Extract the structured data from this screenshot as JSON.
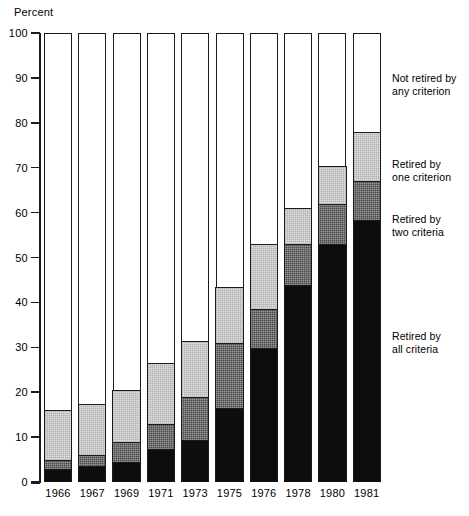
{
  "axis_title": "Percent",
  "y_axis": {
    "label": "Percent",
    "min": 0,
    "max": 100,
    "step": 10,
    "ticks": [
      "0",
      "10",
      "20",
      "30",
      "40",
      "50",
      "60",
      "70",
      "80",
      "90",
      "100"
    ]
  },
  "legend": {
    "entries": [
      {
        "key": "not_retired",
        "line1": "Not retired by",
        "line2": "any criterion",
        "color": "#ffffff"
      },
      {
        "key": "one_criterion",
        "line1": "Retired by",
        "line2": "one criterion",
        "color": "#dedede"
      },
      {
        "key": "two_criteria",
        "line1": "Retired by",
        "line2": "two criteria",
        "color": "#4a4a4a"
      },
      {
        "key": "all_criteria",
        "line1": "Retired by",
        "line2": "all criteria",
        "color": "#0d0d0d"
      }
    ]
  },
  "chart_data": {
    "type": "bar",
    "subtype": "stacked-bar-100-percent",
    "title": "",
    "xlabel": "",
    "ylabel": "Percent",
    "ylim": [
      0,
      100
    ],
    "grid": false,
    "legend_position": "right",
    "categories": [
      "1966",
      "1967",
      "1969",
      "1971",
      "1973",
      "1975",
      "1976",
      "1978",
      "1980",
      "1981"
    ],
    "series": [
      {
        "name": "Retired by all criteria",
        "color": "#0d0d0d",
        "values": [
          3,
          3.5,
          4.5,
          7.5,
          9.5,
          16.5,
          30,
          44,
          53,
          58.5
        ]
      },
      {
        "name": "Retired by two criteria",
        "color": "#4a4a4a",
        "values": [
          2,
          2.5,
          4.5,
          5.5,
          9.5,
          14.5,
          8.5,
          9,
          9,
          8.5
        ]
      },
      {
        "name": "Retired by one criterion",
        "color": "#dedede",
        "values": [
          11,
          11.5,
          11.5,
          13.5,
          12.5,
          12.5,
          14.5,
          8,
          8.5,
          11
        ]
      },
      {
        "name": "Not retired by any criterion",
        "color": "#ffffff",
        "values": [
          84,
          82.5,
          79.5,
          73.5,
          68.5,
          56.5,
          47,
          39,
          29.5,
          22
        ]
      }
    ],
    "cumulative_tops": {
      "all_criteria": [
        3,
        3.5,
        4.5,
        7.5,
        9.5,
        16.5,
        30,
        44,
        53,
        58.5
      ],
      "two_criteria": [
        5,
        6,
        9,
        13,
        19,
        31,
        38.5,
        53,
        62,
        67
      ],
      "one_criterion": [
        16,
        17.5,
        20.5,
        26.5,
        31.5,
        43.5,
        53,
        61,
        70.5,
        78
      ]
    }
  }
}
